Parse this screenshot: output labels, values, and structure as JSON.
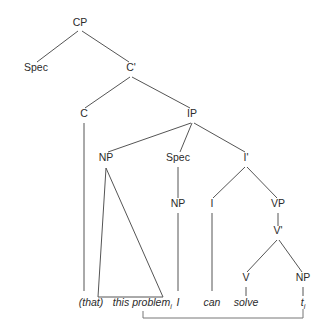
{
  "figure": {
    "width": 324,
    "height": 326,
    "background_color": "#ffffff",
    "line_color": "#555555",
    "text_color": "#2b2b2b",
    "movement_line_color": "#777777"
  },
  "nodes": [
    {
      "id": "CP",
      "label": "CP",
      "x": 80,
      "y": 26
    },
    {
      "id": "Spec_CP",
      "label": "Spec",
      "x": 36,
      "y": 71
    },
    {
      "id": "Cbar",
      "label": "C'",
      "x": 131,
      "y": 71
    },
    {
      "id": "C",
      "label": "C",
      "x": 84,
      "y": 117
    },
    {
      "id": "IP",
      "label": "IP",
      "x": 192,
      "y": 117
    },
    {
      "id": "NP_top",
      "label": "NP",
      "x": 106,
      "y": 161
    },
    {
      "id": "Spec_IP",
      "label": "Spec",
      "x": 178,
      "y": 161
    },
    {
      "id": "Ibar",
      "label": "I'",
      "x": 246,
      "y": 161
    },
    {
      "id": "NP_sub",
      "label": "NP",
      "x": 178,
      "y": 207
    },
    {
      "id": "I",
      "label": "I",
      "x": 212,
      "y": 207
    },
    {
      "id": "VP",
      "label": "VP",
      "x": 278,
      "y": 207
    },
    {
      "id": "Vbar",
      "label": "V'",
      "x": 278,
      "y": 234
    },
    {
      "id": "V",
      "label": "V",
      "x": 246,
      "y": 281
    },
    {
      "id": "NP_obj",
      "label": "NP",
      "x": 303,
      "y": 281
    }
  ],
  "branches": [
    {
      "from": "CP",
      "to": "Spec_CP",
      "x1": 78,
      "y1": 31,
      "x2": 37,
      "y2": 62
    },
    {
      "from": "CP",
      "to": "Cbar",
      "x1": 82,
      "y1": 31,
      "x2": 129,
      "y2": 62
    },
    {
      "from": "Cbar",
      "to": "C",
      "x1": 130,
      "y1": 77,
      "x2": 85,
      "y2": 108
    },
    {
      "from": "Cbar",
      "to": "IP",
      "x1": 132,
      "y1": 77,
      "x2": 190,
      "y2": 108
    },
    {
      "from": "IP",
      "to": "NP_top",
      "x1": 191,
      "y1": 123,
      "x2": 108,
      "y2": 152
    },
    {
      "from": "IP",
      "to": "Spec_IP",
      "x1": 192,
      "y1": 123,
      "x2": 180,
      "y2": 152
    },
    {
      "from": "IP",
      "to": "Ibar",
      "x1": 194,
      "y1": 123,
      "x2": 245,
      "y2": 152
    },
    {
      "from": "Ibar",
      "to": "I",
      "x1": 245,
      "y1": 167,
      "x2": 213,
      "y2": 198
    },
    {
      "from": "Ibar",
      "to": "VP",
      "x1": 247,
      "y1": 167,
      "x2": 277,
      "y2": 198
    },
    {
      "from": "VP",
      "to": "Vbar",
      "x1": 278,
      "y1": 213,
      "x2": 278,
      "y2": 226
    },
    {
      "from": "Vbar",
      "to": "V",
      "x1": 277,
      "y1": 240,
      "x2": 247,
      "y2": 272
    },
    {
      "from": "Vbar",
      "to": "NP_obj",
      "x1": 279,
      "y1": 240,
      "x2": 302,
      "y2": 272
    },
    {
      "from": "C",
      "to": "that",
      "x1": 84,
      "y1": 123,
      "x2": 84,
      "y2": 291
    },
    {
      "from": "NP_sub",
      "to": "I_leaf",
      "x1": 178,
      "y1": 213,
      "x2": 178,
      "y2": 291
    },
    {
      "from": "Spec_IP",
      "to": "NP_sub",
      "x1": 178,
      "y1": 167,
      "x2": 178,
      "y2": 198
    },
    {
      "from": "I",
      "to": "can",
      "x1": 212,
      "y1": 213,
      "x2": 212,
      "y2": 291
    },
    {
      "from": "V",
      "to": "solve",
      "x1": 246,
      "y1": 287,
      "x2": 246,
      "y2": 296
    },
    {
      "from": "NP_obj",
      "to": "trace",
      "x1": 303,
      "y1": 287,
      "x2": 303,
      "y2": 296
    }
  ],
  "triangle": {
    "apex_x": 106,
    "apex_y": 168,
    "left_x": 98,
    "right_x": 163,
    "base_y": 297
  },
  "leaves": [
    {
      "id": "that",
      "text": "(that)",
      "sub": "",
      "x": 91,
      "y": 306
    },
    {
      "id": "this",
      "text": "this",
      "sub": "",
      "x": 121,
      "y": 306
    },
    {
      "id": "problem",
      "text": "problem",
      "sub": "i",
      "x": 152,
      "y": 306
    },
    {
      "id": "I_leaf",
      "text": "I",
      "sub": "",
      "x": 178,
      "y": 306
    },
    {
      "id": "can",
      "text": "can",
      "sub": "",
      "x": 212,
      "y": 306
    },
    {
      "id": "solve",
      "text": "solve",
      "sub": "",
      "x": 246,
      "y": 306
    },
    {
      "id": "trace",
      "text": "t",
      "sub": "i",
      "x": 303,
      "y": 306
    }
  ],
  "movement_arrow": {
    "label": "movement from object trace to fronted NP",
    "start_x": 303,
    "start_y": 309,
    "bottom_y": 318,
    "end_x": 143,
    "tick_top_y": 311
  }
}
